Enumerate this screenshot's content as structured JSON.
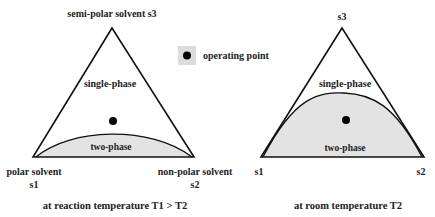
{
  "legend": {
    "marker_label": "operating point",
    "box_color": "#dcdcdc",
    "marker_color": "#000000"
  },
  "left_diagram": {
    "apex_label": "semi-polar solvent s3",
    "left_label_line1": "polar solvent",
    "left_label_line2": "s1",
    "right_label_line1": "non-polar solvent",
    "right_label_line2": "s2",
    "upper_region_label": "single-phase",
    "lower_region_label": "two-phase",
    "caption": "at reaction temperature T1 > T2"
  },
  "right_diagram": {
    "apex_label": "s3",
    "left_label": "s1",
    "right_label": "s2",
    "upper_region_label": "single-phase",
    "lower_region_label": "two-phase",
    "caption": "at room temperature T2"
  },
  "colors": {
    "two_phase_fill": "#e3e3e3",
    "line": "#111111",
    "text": "#222222"
  }
}
